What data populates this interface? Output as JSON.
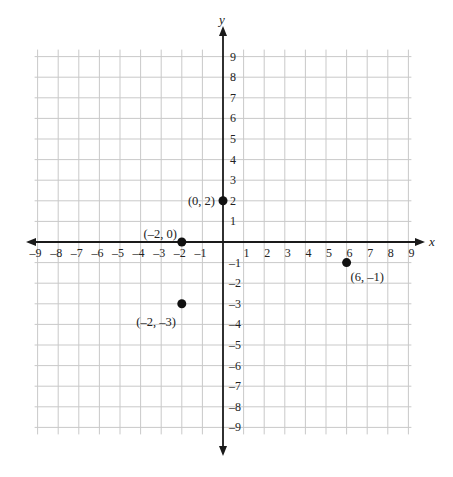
{
  "chart_data": {
    "type": "scatter",
    "title": "",
    "xlabel": "x",
    "ylabel": "y",
    "xlim": [
      -9,
      9
    ],
    "ylim": [
      -9,
      9
    ],
    "grid": true,
    "x_ticks": [
      -9,
      -8,
      -7,
      -6,
      -5,
      -4,
      -3,
      -2,
      -1,
      1,
      2,
      3,
      4,
      5,
      6,
      7,
      8,
      9
    ],
    "y_ticks": [
      9,
      8,
      7,
      6,
      5,
      4,
      3,
      2,
      1,
      -1,
      -2,
      -3,
      -4,
      -5,
      -6,
      -7,
      -8,
      -9
    ],
    "x_tick_labels": [
      "–9",
      "–8",
      "–7",
      "–6",
      "–5",
      "–4",
      "–3",
      "–2",
      "–1",
      "1",
      "2",
      "3",
      "4",
      "5",
      "6",
      "7",
      "8",
      "9"
    ],
    "y_tick_labels": [
      "9",
      "8",
      "7",
      "6",
      "5",
      "4",
      "3",
      "2",
      "1",
      "–1",
      "–2",
      "–3",
      "–4",
      "–5",
      "–6",
      "–7",
      "–8",
      "–9"
    ],
    "points": [
      {
        "x": 0,
        "y": 2,
        "label": "(0, 2)",
        "label_pos": "left"
      },
      {
        "x": -2,
        "y": 0,
        "label": "(–2, 0)",
        "label_pos": "above-left"
      },
      {
        "x": -2,
        "y": -3,
        "label": "(–2, –3)",
        "label_pos": "below-left"
      },
      {
        "x": 6,
        "y": -1,
        "label": "(6, –1)",
        "label_pos": "below-right"
      }
    ],
    "colors": {
      "grid": "#c9c9c9",
      "axis": "#1a1a1a",
      "point": "#111111"
    }
  }
}
